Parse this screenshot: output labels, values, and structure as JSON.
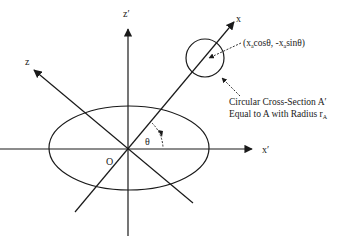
{
  "diagram": {
    "axes": {
      "z_prime": {
        "label": "z′"
      },
      "z": {
        "label": "z"
      },
      "x": {
        "label": "x"
      },
      "x_prime": {
        "label": "x′"
      }
    },
    "origin_label": "O",
    "angle_label": "θ",
    "point_label": {
      "open": "(x",
      "sub1": "a",
      "mid": "cosθ, -x",
      "sub2": "a",
      "close": "sinθ)"
    },
    "caption": {
      "line1": "Circular Cross-Section A′",
      "line2_prefix": "Equal to A with Radius r",
      "line2_sub": "A"
    },
    "colors": {
      "stroke": "#1a1a1a",
      "background": "#ffffff"
    }
  }
}
